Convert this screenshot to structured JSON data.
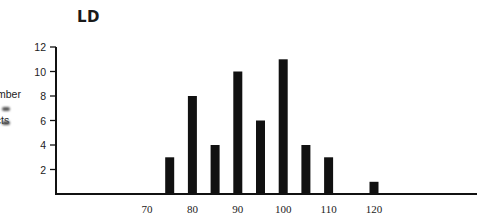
{
  "chart_data": {
    "type": "bar",
    "title": "LD",
    "xlabel": "",
    "ylabel": "Number of Subjects",
    "ylabel_visible_fragments": [
      "mber",
      "f",
      "ects"
    ],
    "categories": [
      75,
      80,
      85,
      90,
      95,
      100,
      105,
      110,
      120
    ],
    "values": [
      3,
      8,
      4,
      10,
      6,
      11,
      4,
      3,
      1
    ],
    "ylim": [
      0,
      12
    ],
    "yticks": [
      2,
      4,
      6,
      8,
      10,
      12
    ],
    "xticks": [
      70,
      80,
      90,
      100,
      110,
      120
    ],
    "grid": false,
    "legend": null,
    "bar_color": "#111111"
  },
  "labels": {
    "title": "LD",
    "ylabel_line1": "mber",
    "ylabel_line2": "f",
    "ylabel_line3": "ects"
  }
}
